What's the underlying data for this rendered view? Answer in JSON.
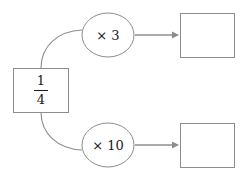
{
  "canvas": {
    "width": 243,
    "height": 178,
    "background": "#ffffff",
    "stroke_color": "#8c8c8c",
    "text_color": "#1a1a1a"
  },
  "diagram": {
    "type": "function-machine-flowchart",
    "input": {
      "shape": "rectangle",
      "label": "1/4",
      "numerator": "1",
      "denominator": "4"
    },
    "branches": [
      {
        "operation_label": "× 3",
        "operation_shape": "ellipse",
        "output_label": "",
        "output_shape": "rectangle",
        "arrow": "right"
      },
      {
        "operation_label": "× 10",
        "operation_shape": "ellipse",
        "output_label": "",
        "output_shape": "rectangle",
        "arrow": "right"
      }
    ]
  }
}
